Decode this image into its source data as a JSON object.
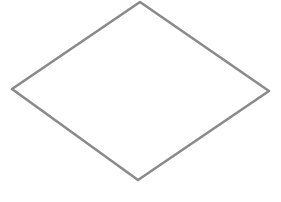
{
  "diagram": {
    "shapes": [
      {
        "type": "diamond",
        "name": "decision-diamond",
        "label": "",
        "points": {
          "top": [
            140,
            2
          ],
          "right": [
            269,
            91
          ],
          "bottom": [
            138,
            180
          ],
          "left": [
            12,
            89
          ]
        },
        "stroke": "#8a8a8a",
        "stroke_width": 2.6,
        "fill": "#ffffff"
      }
    ]
  },
  "colors": {
    "background": "#ffffff",
    "stroke": "#8a8a8a"
  }
}
